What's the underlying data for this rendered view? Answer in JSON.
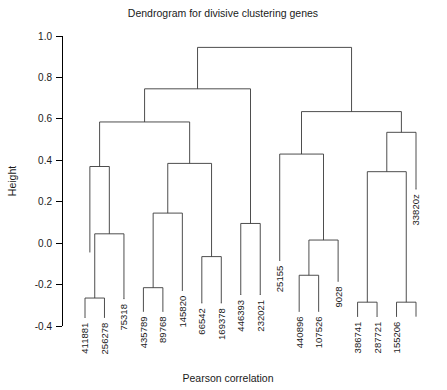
{
  "chart_data": {
    "type": "dendrogram",
    "title": "Dendrogram for divisive clustering genes",
    "xlabel": "Pearson correlation",
    "ylabel": "Height",
    "ylim": [
      -0.4,
      1.0
    ],
    "ytick_values": [
      1.0,
      0.8,
      0.6,
      0.4,
      0.2,
      0.0,
      -0.2,
      -0.4
    ],
    "ytick_labels": [
      "1.0",
      "0.8",
      "0.6",
      "0.4",
      "0.2",
      "0.0",
      "-0.2",
      "-0.4"
    ],
    "grid": false,
    "legend": "none",
    "leaf_order": [
      "411881",
      "256278",
      "75318",
      "435789",
      "89768",
      "145820",
      "66542",
      "169378",
      "446393",
      "232021",
      "25155",
      "440896",
      "107526",
      "9028",
      "386741",
      "287721",
      "155206",
      "33820z"
    ],
    "leaves": [
      {
        "label": "411881",
        "x": 0,
        "height": -0.36
      },
      {
        "label": "256278",
        "x": 1,
        "height": -0.36
      },
      {
        "label": "75318",
        "x": 2,
        "height": -0.27
      },
      {
        "label": "435789",
        "x": 3,
        "height": -0.33
      },
      {
        "label": "89768",
        "x": 4,
        "height": -0.33
      },
      {
        "label": "145820",
        "x": 5,
        "height": -0.23
      },
      {
        "label": "66542",
        "x": 6,
        "height": -0.29
      },
      {
        "label": "169378",
        "x": 7,
        "height": -0.29
      },
      {
        "label": "446393",
        "x": 8,
        "height": -0.25
      },
      {
        "label": "232021",
        "x": 9,
        "height": -0.25
      },
      {
        "label": "25155",
        "x": 10,
        "height": -0.085
      },
      {
        "label": "440896",
        "x": 11,
        "height": -0.33
      },
      {
        "label": "107526",
        "x": 12,
        "height": -0.33
      },
      {
        "label": "9028",
        "x": 13,
        "height": -0.185
      },
      {
        "label": "386741",
        "x": 14,
        "height": -0.355
      },
      {
        "label": "287721",
        "x": 15,
        "height": -0.355
      },
      {
        "label": "155206",
        "x": 16,
        "height": -0.355
      },
      {
        "label": "33820z",
        "x": 17,
        "height": 0.26
      }
    ],
    "merges": [
      {
        "id": "m1",
        "height": -0.265,
        "left": {
          "x": 0,
          "h": -0.36
        },
        "right": {
          "x": 1,
          "h": -0.36
        }
      },
      {
        "id": "m2",
        "height": 0.045,
        "left": {
          "x": 0.5,
          "h": -0.265
        },
        "right": {
          "x": 2,
          "h": -0.27
        }
      },
      {
        "id": "m3",
        "height": 0.37,
        "left": {
          "x": 0.25,
          "h": -0.045
        },
        "right": {
          "x": 1.25,
          "h": 0.045
        }
      },
      {
        "id": "m4",
        "height": -0.215,
        "left": {
          "x": 3,
          "h": -0.33
        },
        "right": {
          "x": 4,
          "h": -0.33
        }
      },
      {
        "id": "m5",
        "height": 0.145,
        "left": {
          "x": 3.5,
          "h": -0.215
        },
        "right": {
          "x": 5,
          "h": -0.23
        }
      },
      {
        "id": "m6",
        "height": -0.065,
        "left": {
          "x": 6,
          "h": -0.29
        },
        "right": {
          "x": 7,
          "h": -0.29
        }
      },
      {
        "id": "m7",
        "height": 0.385,
        "left": {
          "x": 4.25,
          "h": 0.145
        },
        "right": {
          "x": 6.5,
          "h": -0.065
        }
      },
      {
        "id": "m8",
        "height": 0.585,
        "left": {
          "x": 0.75,
          "h": 0.37
        },
        "right": {
          "x": 5.375,
          "h": 0.385
        }
      },
      {
        "id": "m9",
        "height": 0.095,
        "left": {
          "x": 8,
          "h": -0.25
        },
        "right": {
          "x": 9,
          "h": -0.25
        }
      },
      {
        "id": "m10",
        "height": 0.745,
        "left": {
          "x": 3.06,
          "h": 0.585
        },
        "right": {
          "x": 8.5,
          "h": 0.095
        }
      },
      {
        "id": "m11",
        "height": -0.155,
        "left": {
          "x": 11,
          "h": -0.33
        },
        "right": {
          "x": 12,
          "h": -0.33
        }
      },
      {
        "id": "m12",
        "height": 0.015,
        "left": {
          "x": 11.5,
          "h": -0.155
        },
        "right": {
          "x": 13,
          "h": -0.185
        }
      },
      {
        "id": "m13",
        "height": 0.43,
        "left": {
          "x": 10,
          "h": -0.085
        },
        "right": {
          "x": 12.25,
          "h": 0.015
        }
      },
      {
        "id": "m14",
        "height": -0.285,
        "left": {
          "x": 14,
          "h": -0.355
        },
        "right": {
          "x": 15,
          "h": -0.355
        }
      },
      {
        "id": "m15",
        "height": -0.285,
        "left": {
          "x": 16,
          "h": -0.355
        },
        "right": {
          "x": 17,
          "h": -0.355
        }
      },
      {
        "id": "m16",
        "height": 0.345,
        "left": {
          "x": 14.5,
          "h": -0.285
        },
        "right": {
          "x": 16.5,
          "h": -0.285
        }
      },
      {
        "id": "m17",
        "height": 0.535,
        "left": {
          "x": 15.5,
          "h": 0.345
        },
        "right": {
          "x": 17,
          "h": 0.26
        }
      },
      {
        "id": "m18",
        "height": 0.635,
        "left": {
          "x": 11.12,
          "h": 0.43
        },
        "right": {
          "x": 16.25,
          "h": 0.535
        }
      },
      {
        "id": "m19",
        "height": 0.945,
        "left": {
          "x": 5.78,
          "h": 0.745
        },
        "right": {
          "x": 13.69,
          "h": 0.635
        }
      }
    ]
  }
}
